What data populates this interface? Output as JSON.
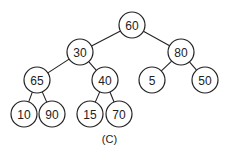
{
  "tree": {
    "nodes": [
      {
        "id": "n60",
        "label": "60"
      },
      {
        "id": "n30",
        "label": "30"
      },
      {
        "id": "n80",
        "label": "80"
      },
      {
        "id": "n65",
        "label": "65"
      },
      {
        "id": "n40",
        "label": "40"
      },
      {
        "id": "n5",
        "label": "5"
      },
      {
        "id": "n50",
        "label": "50"
      },
      {
        "id": "n10",
        "label": "10"
      },
      {
        "id": "n90",
        "label": "90"
      },
      {
        "id": "n15",
        "label": "15"
      },
      {
        "id": "n70",
        "label": "70"
      }
    ],
    "edges": [
      [
        "n60",
        "n30"
      ],
      [
        "n60",
        "n80"
      ],
      [
        "n30",
        "n65"
      ],
      [
        "n30",
        "n40"
      ],
      [
        "n80",
        "n5"
      ],
      [
        "n80",
        "n50"
      ],
      [
        "n65",
        "n10"
      ],
      [
        "n65",
        "n90"
      ],
      [
        "n40",
        "n15"
      ],
      [
        "n40",
        "n70"
      ]
    ]
  },
  "caption": "(C)"
}
